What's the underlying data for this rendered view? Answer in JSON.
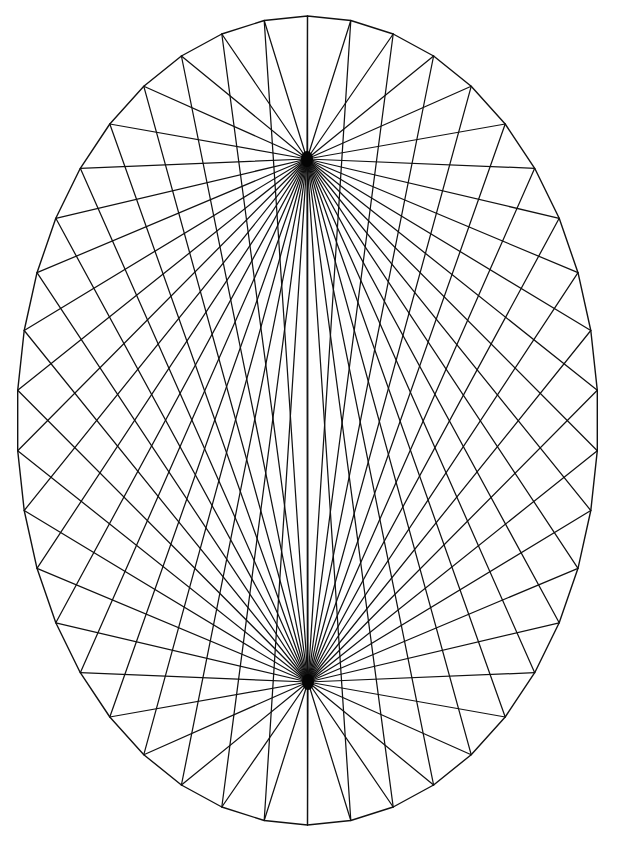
{
  "diagram": {
    "title": "",
    "canvas": {
      "width": 620,
      "height": 841,
      "background": "#ffffff"
    },
    "line_color": "#111111",
    "focus_color": "#050505",
    "ellipse": {
      "center": [
        307.5,
        420.5
      ],
      "semi_axis_x": 290.6,
      "semi_axis_y": 404.5,
      "vertex_count": 42,
      "start_angle_deg": -90
    },
    "foci": [
      {
        "name": "upper-focus",
        "x": 307,
        "y": 159,
        "r": 6
      },
      {
        "name": "lower-focus",
        "x": 308,
        "y": 682,
        "r": 6
      }
    ],
    "vertices": [
      [
        307.5,
        16.0
      ],
      [
        350.8,
        20.5
      ],
      [
        393.2,
        34.0
      ],
      [
        433.6,
        56.0
      ],
      [
        471.2,
        86.3
      ],
      [
        505.2,
        124.0
      ],
      [
        534.7,
        168.3
      ],
      [
        559.2,
        218.3
      ],
      [
        578.0,
        272.7
      ],
      [
        590.8,
        330.5
      ],
      [
        597.3,
        390.3
      ],
      [
        597.3,
        450.7
      ],
      [
        590.8,
        510.5
      ],
      [
        578.0,
        568.3
      ],
      [
        559.2,
        622.8
      ],
      [
        534.7,
        672.7
      ],
      [
        505.2,
        717.0
      ],
      [
        471.2,
        754.7
      ],
      [
        433.6,
        785.0
      ],
      [
        393.2,
        807.0
      ],
      [
        350.8,
        820.5
      ],
      [
        307.5,
        825.0
      ],
      [
        264.2,
        820.5
      ],
      [
        221.8,
        807.0
      ],
      [
        181.4,
        785.0
      ],
      [
        143.8,
        754.7
      ],
      [
        109.8,
        717.0
      ],
      [
        80.3,
        672.7
      ],
      [
        55.8,
        622.8
      ],
      [
        37.0,
        568.3
      ],
      [
        24.2,
        510.5
      ],
      [
        17.7,
        450.7
      ],
      [
        17.7,
        390.3
      ],
      [
        24.2,
        330.5
      ],
      [
        37.0,
        272.7
      ],
      [
        55.8,
        218.3
      ],
      [
        80.3,
        168.3
      ],
      [
        109.8,
        124.0
      ],
      [
        143.8,
        86.3
      ],
      [
        181.4,
        56.0
      ],
      [
        221.8,
        34.0
      ],
      [
        264.2,
        20.5
      ]
    ]
  }
}
